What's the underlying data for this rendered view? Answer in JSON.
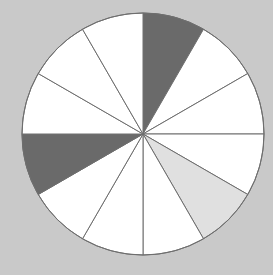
{
  "background_color": "#c9c9c9",
  "chart_data": {
    "type": "pie",
    "title": "",
    "subtitle": "",
    "xlabel": "",
    "ylabel": "",
    "legend": [],
    "annotations": [],
    "grid": false,
    "total_slices": 12,
    "slice_angle_degrees": 30,
    "start_angle_degrees": -90,
    "direction": "clockwise",
    "center": {
      "x": 143,
      "y": 134
    },
    "radius": 121,
    "stroke_color": "#6e6e6e",
    "stroke_width": 1,
    "shaded_count": 3,
    "shaded_fraction": "3/12",
    "categories": [
      "slice-1",
      "slice-2",
      "slice-3",
      "slice-4",
      "slice-5",
      "slice-6",
      "slice-7",
      "slice-8",
      "slice-9",
      "slice-10",
      "slice-11",
      "slice-12"
    ],
    "values": [
      8.3333,
      8.3333,
      8.3333,
      8.3333,
      8.3333,
      8.3333,
      8.3333,
      8.3333,
      8.3333,
      8.3333,
      8.3333,
      8.3333
    ],
    "slices": [
      {
        "index": 1,
        "label": "slice-1",
        "start_deg": -90,
        "end_deg": -60,
        "fill": "#6a6a6a",
        "shade": "dark-gray"
      },
      {
        "index": 2,
        "label": "slice-2",
        "start_deg": -60,
        "end_deg": -30,
        "fill": "#ffffff",
        "shade": "white"
      },
      {
        "index": 3,
        "label": "slice-3",
        "start_deg": -30,
        "end_deg": 0,
        "fill": "#ffffff",
        "shade": "white"
      },
      {
        "index": 4,
        "label": "slice-4",
        "start_deg": 0,
        "end_deg": 30,
        "fill": "#ffffff",
        "shade": "white"
      },
      {
        "index": 5,
        "label": "slice-5",
        "start_deg": 30,
        "end_deg": 60,
        "fill": "#e0e0e0",
        "shade": "light-gray"
      },
      {
        "index": 6,
        "label": "slice-6",
        "start_deg": 60,
        "end_deg": 90,
        "fill": "#ffffff",
        "shade": "white"
      },
      {
        "index": 7,
        "label": "slice-7",
        "start_deg": 90,
        "end_deg": 120,
        "fill": "#ffffff",
        "shade": "white"
      },
      {
        "index": 8,
        "label": "slice-8",
        "start_deg": 120,
        "end_deg": 150,
        "fill": "#ffffff",
        "shade": "white"
      },
      {
        "index": 9,
        "label": "slice-9",
        "start_deg": 150,
        "end_deg": 180,
        "fill": "#6a6a6a",
        "shade": "dark-gray"
      },
      {
        "index": 10,
        "label": "slice-10",
        "start_deg": 180,
        "end_deg": 210,
        "fill": "#ffffff",
        "shade": "white"
      },
      {
        "index": 11,
        "label": "slice-11",
        "start_deg": 210,
        "end_deg": 240,
        "fill": "#ffffff",
        "shade": "white"
      },
      {
        "index": 12,
        "label": "slice-12",
        "start_deg": 240,
        "end_deg": 270,
        "fill": "#ffffff",
        "shade": "white"
      }
    ]
  }
}
